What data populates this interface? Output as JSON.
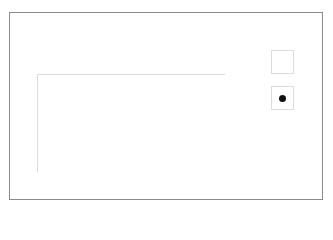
{
  "key": {
    "title": "Key",
    "items": [
      {
        "label": "knit",
        "symbol": "empty"
      },
      {
        "label": "purl",
        "symbol": "dot"
      }
    ]
  },
  "column_labels_top": [
    "8",
    "7",
    "6",
    "5",
    "4",
    "3",
    "2",
    "1"
  ],
  "column_labels_bottom": [
    "8",
    "7",
    "6",
    "5",
    "4",
    "3",
    "2",
    "1"
  ],
  "row_labels_left": {
    "row4": "4",
    "row2": "2"
  },
  "row_labels_right": {
    "row3": "3",
    "row1": "1"
  },
  "grid": {
    "rows": [
      {
        "row": 4,
        "cells": [
          "purl",
          "purl",
          "knit",
          "knit",
          "purl",
          "purl",
          "knit",
          "knit"
        ]
      },
      {
        "row": 3,
        "cells": [
          "purl",
          "purl",
          "knit",
          "knit",
          "purl",
          "purl",
          "knit",
          "knit"
        ]
      },
      {
        "row": 2,
        "cells": [
          "purl",
          "purl",
          "knit",
          "knit",
          "purl",
          "purl",
          "knit",
          "knit"
        ]
      },
      {
        "row": 1,
        "cells": [
          "purl",
          "purl",
          "knit",
          "knit",
          "purl",
          "purl",
          "knit",
          "knit"
        ]
      }
    ]
  }
}
